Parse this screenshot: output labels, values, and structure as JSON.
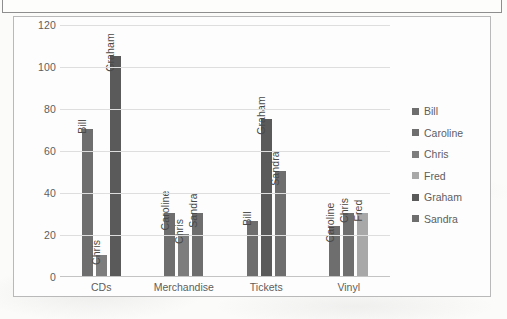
{
  "chart_data": {
    "type": "bar",
    "title": "",
    "xlabel": "",
    "ylabel": "",
    "ylim": [
      0,
      120
    ],
    "yticks": [
      0,
      20,
      40,
      60,
      80,
      100,
      120
    ],
    "grid": true,
    "legend_position": "right",
    "categories": [
      "CDs",
      "Merchandise",
      "Tickets",
      "Vinyl"
    ],
    "legend": [
      "Bill",
      "Caroline",
      "Chris",
      "Fred",
      "Graham",
      "Sandra"
    ],
    "series": [
      {
        "name": "Bill",
        "values": [
          70,
          null,
          26,
          null
        ]
      },
      {
        "name": "Caroline",
        "values": [
          null,
          30,
          null,
          24
        ]
      },
      {
        "name": "Chris",
        "values": [
          10,
          20,
          null,
          30
        ]
      },
      {
        "name": "Fred",
        "values": [
          null,
          null,
          null,
          30
        ]
      },
      {
        "name": "Graham",
        "values": [
          105,
          null,
          75,
          null
        ]
      },
      {
        "name": "Sandra",
        "values": [
          null,
          30,
          50,
          null
        ]
      }
    ],
    "groups": [
      {
        "category": "CDs",
        "bars": [
          {
            "label": "Bill",
            "value": 70,
            "color": "#6e6e6e"
          },
          {
            "label": "Chris",
            "value": 10,
            "color": "#7d7d7d"
          },
          {
            "label": "Graham",
            "value": 105,
            "color": "#5a5a5a"
          }
        ]
      },
      {
        "category": "Merchandise",
        "bars": [
          {
            "label": "Caroline",
            "value": 30,
            "color": "#6e6e6e"
          },
          {
            "label": "Chris",
            "value": 20,
            "color": "#7d7d7d"
          },
          {
            "label": "Sandra",
            "value": 30,
            "color": "#6e6e6e"
          }
        ]
      },
      {
        "category": "Tickets",
        "bars": [
          {
            "label": "Bill",
            "value": 26,
            "color": "#6e6e6e"
          },
          {
            "label": "Graham",
            "value": 75,
            "color": "#5a5a5a"
          },
          {
            "label": "Sandra",
            "value": 50,
            "color": "#6e6e6e"
          }
        ]
      },
      {
        "category": "Vinyl",
        "bars": [
          {
            "label": "Caroline",
            "value": 24,
            "color": "#6e6e6e"
          },
          {
            "label": "Chris",
            "value": 30,
            "color": "#6e6e6e"
          },
          {
            "label": "Fred",
            "value": 30,
            "color": "#a8a8a8"
          }
        ]
      }
    ],
    "legend_colors": {
      "Bill": "#6e6e6e",
      "Caroline": "#6e6e6e",
      "Chris": "#7d7d7d",
      "Fred": "#a8a8a8",
      "Graham": "#5a5a5a",
      "Sandra": "#6e6e6e"
    }
  }
}
